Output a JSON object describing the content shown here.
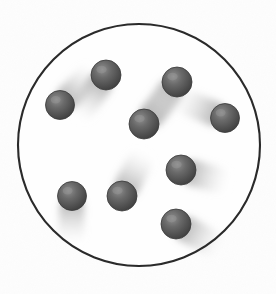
{
  "figure": {
    "kind": "particle-motion-diagram",
    "width": 276,
    "height": 294
  },
  "colors": {
    "background": "#fdfdfd",
    "paper_tint": "#f7f7f5",
    "container_stroke": "#2a2a2a",
    "container_fill": "#fefefe",
    "sphere_highlight": "#8a8a8a",
    "sphere_mid": "#636363",
    "sphere_edge": "#434343",
    "sphere_rim": "#3a3a3a",
    "trail": "#8d8d8d"
  },
  "container": {
    "label": "circular-container",
    "cx": 139,
    "cy": 145,
    "r": 121,
    "stroke_width": 2.1
  },
  "particles": [
    {
      "id": "particle-1",
      "label": "particle-upper-left",
      "cx": 60,
      "cy": 105,
      "r": 14.5,
      "trail_angle_deg": 315,
      "trail_length": 52,
      "trail_width": 25
    },
    {
      "id": "particle-2",
      "label": "particle-top-left",
      "cx": 106,
      "cy": 75,
      "r": 15,
      "trail_angle_deg": 125,
      "trail_length": 55,
      "trail_width": 26
    },
    {
      "id": "particle-3",
      "label": "particle-top-right",
      "cx": 177,
      "cy": 82,
      "r": 15,
      "trail_angle_deg": 128,
      "trail_length": 56,
      "trail_width": 26
    },
    {
      "id": "particle-4",
      "label": "particle-center",
      "cx": 144,
      "cy": 124,
      "r": 15,
      "trail_angle_deg": 311,
      "trail_length": 60,
      "trail_width": 26
    },
    {
      "id": "particle-5",
      "label": "particle-right-middle",
      "cx": 225,
      "cy": 118,
      "r": 14.5,
      "trail_angle_deg": 202,
      "trail_length": 56,
      "trail_width": 25
    },
    {
      "id": "particle-6",
      "label": "particle-right-lower",
      "cx": 181,
      "cy": 170,
      "r": 15,
      "trail_angle_deg": 15,
      "trail_length": 52,
      "trail_width": 26
    },
    {
      "id": "particle-7",
      "label": "particle-lower-left",
      "cx": 72,
      "cy": 196,
      "r": 14.5,
      "trail_angle_deg": 91,
      "trail_length": 50,
      "trail_width": 25
    },
    {
      "id": "particle-8",
      "label": "particle-lower-center",
      "cx": 122,
      "cy": 196,
      "r": 15,
      "trail_angle_deg": 297,
      "trail_length": 52,
      "trail_width": 26
    },
    {
      "id": "particle-9",
      "label": "particle-bottom-right",
      "cx": 176,
      "cy": 224,
      "r": 15,
      "trail_angle_deg": 28,
      "trail_length": 54,
      "trail_width": 26
    },
    {
      "id": "particle-10",
      "label": "particle-upper-right-inner",
      "cx": 214,
      "cy": 117,
      "r": 0,
      "trail_angle_deg": 0,
      "trail_length": 0,
      "trail_width": 0
    }
  ]
}
